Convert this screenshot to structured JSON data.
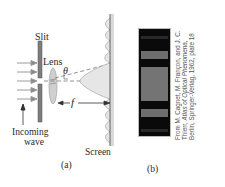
{
  "figure_a": {
    "labels": {
      "slit": "Slit",
      "lens": "Lens",
      "theta": "θ",
      "focal": "f",
      "incoming_line1": "Incoming",
      "incoming_line2": "wave",
      "screen": "Screen",
      "caption": "(a)"
    }
  },
  "figure_b": {
    "caption": "(b)",
    "credit": {
      "prefix": "From M. Cagnet, M. Françon, and J. C. Thierr, ",
      "title": "Atlas of Optical Phenomena",
      "suffix": ", Berlin, Springer-Verlag, 1962, plate 18"
    },
    "bands_color": "#6e6e6e",
    "background_color": "#0a0a0a"
  }
}
